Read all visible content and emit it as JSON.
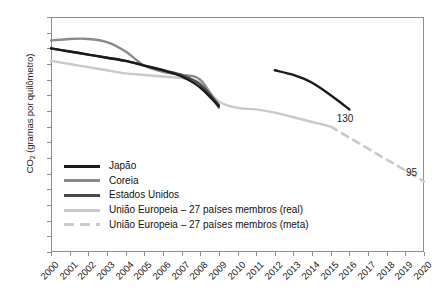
{
  "chart_data": {
    "type": "line",
    "title": "",
    "xlabel": "",
    "ylabel": "CO2 (gramas por quilômetro)",
    "ylabel_prefix": "CO",
    "ylabel_sub": "2",
    "ylabel_suffix": " (gramas por quilômetro)",
    "xlim": [
      2000,
      2020
    ],
    "ylim": [
      50,
      200
    ],
    "grid": false,
    "legend_position": "inside-lower-left",
    "x_ticks": [
      "2000",
      "2001",
      "2002",
      "2003",
      "2004",
      "2005",
      "2006",
      "2007",
      "2008",
      "2009",
      "2010",
      "2011",
      "2012",
      "2013",
      "2014",
      "2015",
      "2016",
      "2017",
      "2018",
      "2019",
      "2020"
    ],
    "y_ticks": [
      "50",
      "60",
      "70",
      "80",
      "90",
      "100",
      "110",
      "120",
      "130",
      "140",
      "150",
      "160",
      "170",
      "180",
      "190",
      "200"
    ],
    "series": [
      {
        "name": "Japão",
        "color": "#1a1a1a",
        "style": "solid",
        "x": [
          2000,
          2001,
          2002,
          2003,
          2004,
          2005,
          2006,
          2007,
          2008,
          2009
        ],
        "values": [
          180,
          178,
          176,
          174,
          172,
          169,
          166,
          162,
          155,
          143
        ]
      },
      {
        "name": "Japão (projeção)",
        "color": "#1a1a1a",
        "style": "solid",
        "x": [
          2012,
          2013,
          2014,
          2015,
          2016
        ],
        "values": [
          166,
          163,
          158,
          150,
          141
        ]
      },
      {
        "name": "Coreia",
        "color": "#8a8a8a",
        "style": "solid",
        "x": [
          2000,
          2001,
          2002,
          2003,
          2004,
          2005,
          2006,
          2007,
          2008,
          2009
        ],
        "values": [
          185,
          186,
          186,
          184,
          178,
          169,
          165,
          163,
          160,
          142
        ]
      },
      {
        "name": "Estados Unidos",
        "color": "#4a4a4a",
        "style": "solid",
        "x": [
          2000,
          2001,
          2002,
          2003,
          2004,
          2005,
          2006,
          2007,
          2008,
          2009
        ],
        "values": [
          180,
          178,
          176,
          174,
          172,
          169,
          166,
          163,
          157,
          144
        ]
      },
      {
        "name": "União Europeia – 27 países membros (real)",
        "color": "#c9c9c9",
        "style": "solid",
        "x": [
          2000,
          2001,
          2002,
          2003,
          2004,
          2005,
          2006,
          2007,
          2008,
          2009,
          2010,
          2011,
          2012,
          2013,
          2014,
          2015
        ],
        "values": [
          172,
          170,
          168,
          166,
          164,
          163,
          162,
          161,
          158,
          146,
          142,
          141,
          139,
          136,
          133,
          130
        ]
      },
      {
        "name": "União Europeia – 27 países membros (meta)",
        "color": "#c9c9c9",
        "style": "dashed",
        "x": [
          2015,
          2016,
          2017,
          2018,
          2019,
          2020
        ],
        "values": [
          130,
          123,
          116,
          109,
          102,
          95
        ]
      }
    ],
    "annotations": [
      {
        "label": "130",
        "x": 2015,
        "y": 130,
        "dx": 6,
        "dy": -2
      },
      {
        "label": "95",
        "x": 2020,
        "y": 95,
        "dx": -18,
        "dy": -3
      }
    ]
  },
  "legend": {
    "items": [
      {
        "label": "Japão",
        "color": "#1a1a1a",
        "style": "solid"
      },
      {
        "label": "Coreia",
        "color": "#8a8a8a",
        "style": "solid"
      },
      {
        "label": "Estados Unidos",
        "color": "#4a4a4a",
        "style": "solid"
      },
      {
        "label": "União Europeia – 27 países membros (real)",
        "color": "#c9c9c9",
        "style": "solid"
      },
      {
        "label": "União Europeia – 27 países membros (meta)",
        "color": "#c9c9c9",
        "style": "dashed"
      }
    ]
  }
}
